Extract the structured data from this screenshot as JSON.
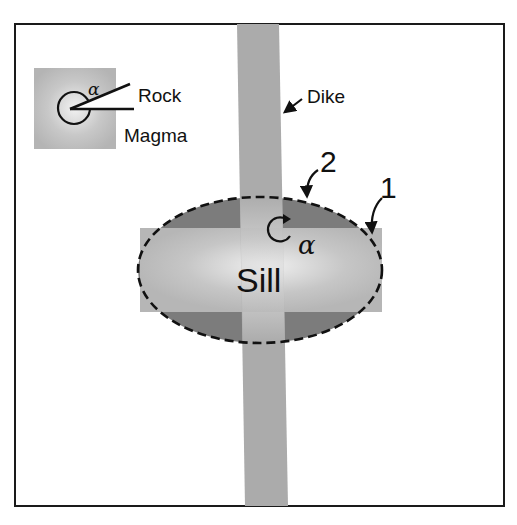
{
  "diagram": {
    "type": "geology-schematic",
    "colors": {
      "frame": "#1a1a1a",
      "background": "#ffffff",
      "magma_light": "#efefef",
      "magma_mid": "#b9b9b9",
      "dike_fill": "#aaaaaa",
      "dark_region": "#7c7c7c",
      "ink": "#111111"
    },
    "inset": {
      "rock_label": "Rock",
      "magma_label": "Magma",
      "angle_symbol": "α"
    },
    "labels": {
      "dike": "Dike",
      "sill": "Sill",
      "boundary_1": "1",
      "boundary_2": "2",
      "corner_angle_symbol": "α"
    }
  }
}
